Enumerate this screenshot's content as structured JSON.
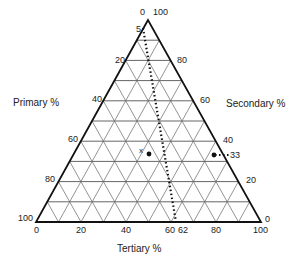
{
  "diagram": {
    "type": "ternary",
    "axes": {
      "left": {
        "title": "Primary %",
        "ticks": [
          "20",
          "40",
          "60",
          "80",
          "100"
        ]
      },
      "right": {
        "title": "Secondary %",
        "ticks": [
          "80",
          "60",
          "40",
          "33",
          "20",
          "0"
        ]
      },
      "bottom": {
        "title": "Tertiary %",
        "ticks": [
          "0",
          "20",
          "40",
          "60",
          "62",
          "80",
          "100"
        ]
      },
      "apex": {
        "left_tick": "0",
        "right_tick": "100",
        "extra_tick": "5"
      }
    },
    "point_marker_label": "x",
    "colors": {
      "frame": "#111111",
      "grid": "#555555",
      "dots": "#111111"
    }
  }
}
